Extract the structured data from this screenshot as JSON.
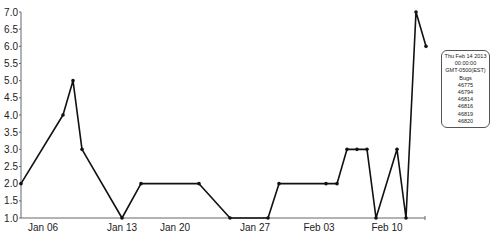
{
  "chart_data": {
    "type": "line",
    "title": "",
    "xlabel": "",
    "ylabel": "",
    "ylim": [
      1.0,
      7.0
    ],
    "grid": false,
    "y_ticks": [
      "1.0",
      "1.5",
      "2.0",
      "2.5",
      "3.0",
      "3.5",
      "4.0",
      "4.5",
      "5.0",
      "5.5",
      "6.0",
      "6.5",
      "7.0"
    ],
    "x_ticks": [
      "Jan 06",
      "Jan 13",
      "Jan 20",
      "Jan 27",
      "Feb 03",
      "Feb 10"
    ],
    "series": [
      {
        "name": "Bugs",
        "points": [
          {
            "x": "Jan 04",
            "y": 2.0
          },
          {
            "x": "Jan 08",
            "y": 4.0
          },
          {
            "x": "Jan 09",
            "y": 5.0
          },
          {
            "x": "Jan 10",
            "y": 3.0
          },
          {
            "x": "Jan 13",
            "y": 1.0
          },
          {
            "x": "Jan 15",
            "y": 2.0
          },
          {
            "x": "Jan 21",
            "y": 2.0
          },
          {
            "x": "Jan 24",
            "y": 1.0
          },
          {
            "x": "Jan 28",
            "y": 1.0
          },
          {
            "x": "Jan 29",
            "y": 2.0
          },
          {
            "x": "Feb 03",
            "y": 2.0
          },
          {
            "x": "Feb 04",
            "y": 2.0
          },
          {
            "x": "Feb 05",
            "y": 3.0
          },
          {
            "x": "Feb 06",
            "y": 3.0
          },
          {
            "x": "Feb 07",
            "y": 3.0
          },
          {
            "x": "Feb 08",
            "y": 1.0
          },
          {
            "x": "Feb 10",
            "y": 3.0
          },
          {
            "x": "Feb 11",
            "y": 1.0
          },
          {
            "x": "Feb 12",
            "y": 7.0
          },
          {
            "x": "Feb 13",
            "y": 6.0
          }
        ]
      }
    ],
    "tooltip": {
      "lines": [
        "Thu Feb 14 2013",
        "00:00:00",
        "GMT-0500(EST)",
        "Bugs",
        "46775",
        "46794",
        "46814",
        "46816",
        "46819",
        "46820"
      ]
    }
  },
  "layout": {
    "plot": {
      "x0": 21,
      "x1": 425,
      "y_top": 12,
      "y_bottom": 218
    },
    "x_tick_px": [
      43,
      122,
      175,
      255,
      319,
      387
    ],
    "point_px_x": [
      21,
      63,
      73,
      82,
      122,
      141,
      199,
      230,
      268,
      279,
      326,
      337,
      347,
      357,
      367,
      376,
      397,
      406,
      416,
      426
    ],
    "line_color": "#111111"
  }
}
